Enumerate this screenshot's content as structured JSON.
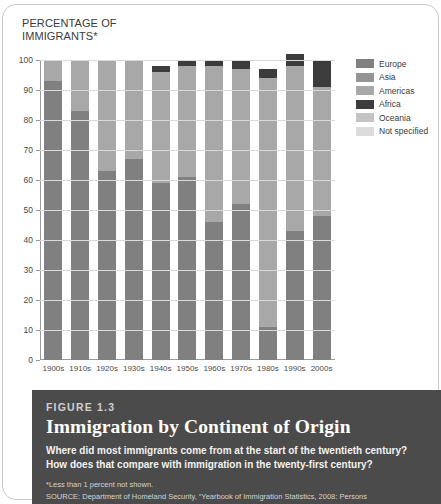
{
  "axis_title": "PERCENTAGE OF\nIMMIGRANTS*",
  "legend": {
    "items": [
      {
        "label": "Europe",
        "color": "#808080"
      },
      {
        "label": "Asia",
        "color": "#949494"
      },
      {
        "label": "Americas",
        "color": "#a8a8a8"
      },
      {
        "label": "Africa",
        "color": "#3c3c3c"
      },
      {
        "label": "Oceania",
        "color": "#c4c4c4"
      },
      {
        "label": "Not specified",
        "color": "#dcdcdc"
      }
    ]
  },
  "caption": {
    "figure_number": "FIGURE 1.3",
    "title": "Immigration by Continent of Origin",
    "subtitle": "Where did most immigrants come from at the start of the twentieth century? How does that compare with immigration in the twenty-first century?",
    "note": "*Less than 1 percent not shown.",
    "source": "SOURCE: Department of Homeland Security, “Yearbook of Immigration Statistics, 2008: Persons"
  },
  "chart_data": {
    "type": "bar",
    "stacked": true,
    "title": "Immigration by Continent of Origin",
    "xlabel": "",
    "ylabel": "PERCENTAGE OF IMMIGRANTS*",
    "ylim": [
      0,
      100
    ],
    "yticks": [
      0,
      10,
      20,
      30,
      40,
      50,
      60,
      70,
      80,
      90,
      100
    ],
    "grid": true,
    "legend_position": "right",
    "categories": [
      "1900s",
      "1910s",
      "1920s",
      "1930s",
      "1940s",
      "1950s",
      "1960s",
      "1970s",
      "1980s",
      "1990s",
      "2000s"
    ],
    "series": [
      {
        "name": "Europe",
        "color": "#808080",
        "values": [
          93,
          83,
          63,
          67,
          59,
          61,
          46,
          52,
          11,
          43,
          48
        ]
      },
      {
        "name": "Asia",
        "color": "#949494",
        "values": [
          0,
          0,
          0,
          0,
          0,
          0,
          0,
          0,
          0,
          0,
          0
        ]
      },
      {
        "name": "Americas",
        "color": "#a8a8a8",
        "values": [
          7,
          17,
          37,
          33,
          37,
          37,
          52,
          45,
          83,
          55,
          43
        ]
      },
      {
        "name": "Africa",
        "color": "#3c3c3c",
        "values": [
          0,
          0,
          0,
          0,
          2,
          2,
          2,
          3,
          3,
          4,
          9
        ]
      },
      {
        "name": "Oceania",
        "color": "#c4c4c4",
        "values": [
          0,
          0,
          0,
          0,
          0,
          0,
          0,
          0,
          0,
          0,
          0
        ]
      },
      {
        "name": "Not specified",
        "color": "#dcdcdc",
        "values": [
          0,
          0,
          0,
          0,
          0,
          0,
          0,
          0,
          0,
          0,
          0
        ]
      }
    ],
    "bar_totals": [
      100,
      100,
      100,
      100,
      98,
      100,
      100,
      100,
      94,
      99,
      98
    ]
  }
}
